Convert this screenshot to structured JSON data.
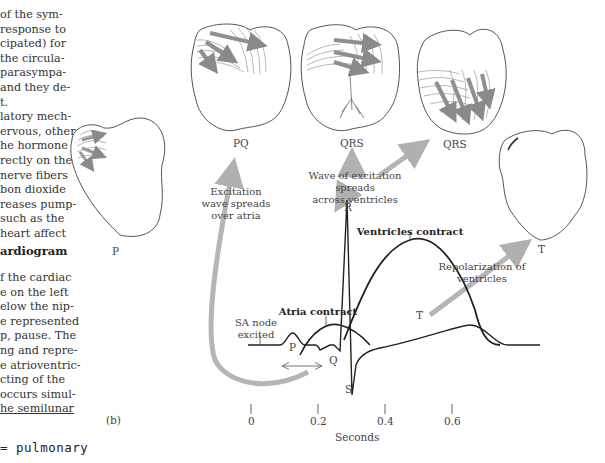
{
  "page_text": {
    "paragraph_1_lines": [
      "of the sym-",
      "response to",
      "cipated) for",
      "the circula-",
      "parasympa-",
      "and they de-",
      "t.",
      "latory mech-",
      "ervous, other",
      "he hormone",
      "rectly on the",
      "nerve fibers",
      "bon dioxide",
      "reases pump-",
      "such as the",
      "heart affect"
    ],
    "section_heading": "ardiogram",
    "paragraph_2_lines": [
      "f the cardiac",
      "e on the left",
      "elow the nip-",
      "e represented",
      "p, pause. The",
      "ng and repre-",
      "e atrioventric-",
      "cting of the",
      "occurs simul-",
      "he semilunar"
    ],
    "underlined_word": "semilunar",
    "handwritten_note": "= pulmonary"
  },
  "figure": {
    "panel_label": "(b)",
    "heart_labels": [
      "P",
      "PQ",
      "QRS",
      "QRS",
      "T"
    ],
    "annotations": {
      "excitation_atria": [
        "Excitation",
        "wave spreads",
        "over atria"
      ],
      "excitation_ventricles": [
        "Wave of excitation spreads",
        "across ventricles"
      ],
      "ventricles_contract": "Ventricles contract",
      "atria_contract": "Atria contract",
      "sa_node": [
        "SA node",
        "excited"
      ],
      "repolarization": [
        "Repolarization of",
        "ventricles"
      ]
    },
    "ecg_wave_labels": {
      "P": "P",
      "Q": "Q",
      "R": "R",
      "S": "S",
      "T": "T"
    },
    "x_axis": {
      "ticks": [
        "0",
        "0.2",
        "0.4",
        "0.6"
      ],
      "label": "Seconds"
    },
    "colors": {
      "line": "#222222",
      "arrow": "#b0b0b0",
      "heart_outline": "#555555",
      "wave_hatch": "#8a8a8a"
    }
  }
}
